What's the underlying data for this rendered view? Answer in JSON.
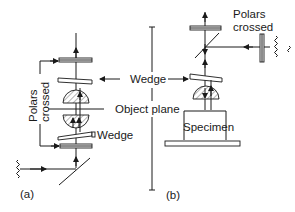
{
  "diagram": {
    "type": "polarized-light-microscope-schematic",
    "panels": [
      {
        "id": "a",
        "label": "(a)",
        "mode": "transmitted light",
        "components_bottom_to_top": [
          "light-source",
          "mirror",
          "polarizer",
          "wedge",
          "condenser",
          "object-plane",
          "objective",
          "wedge",
          "analyzer"
        ]
      },
      {
        "id": "b",
        "label": "(b)",
        "mode": "reflected light",
        "components_bottom_to_top": [
          "stage",
          "specimen",
          "objective",
          "wedge",
          "beam-splitter",
          "analyzer",
          "polarizer",
          "light-source"
        ]
      }
    ],
    "labels": {
      "polars_crossed_a": [
        "Polars",
        "crossed"
      ],
      "polars_crossed_b": [
        "Polars",
        "crossed"
      ],
      "wedge_center": "Wedge",
      "wedge_a_lower": "Wedge",
      "object_plane": "Object plane",
      "specimen": "Specimen",
      "panel_a": "(a)",
      "panel_b": "(b)"
    },
    "colors": {
      "line": "#1a1a1a",
      "background": "#ffffff"
    }
  }
}
